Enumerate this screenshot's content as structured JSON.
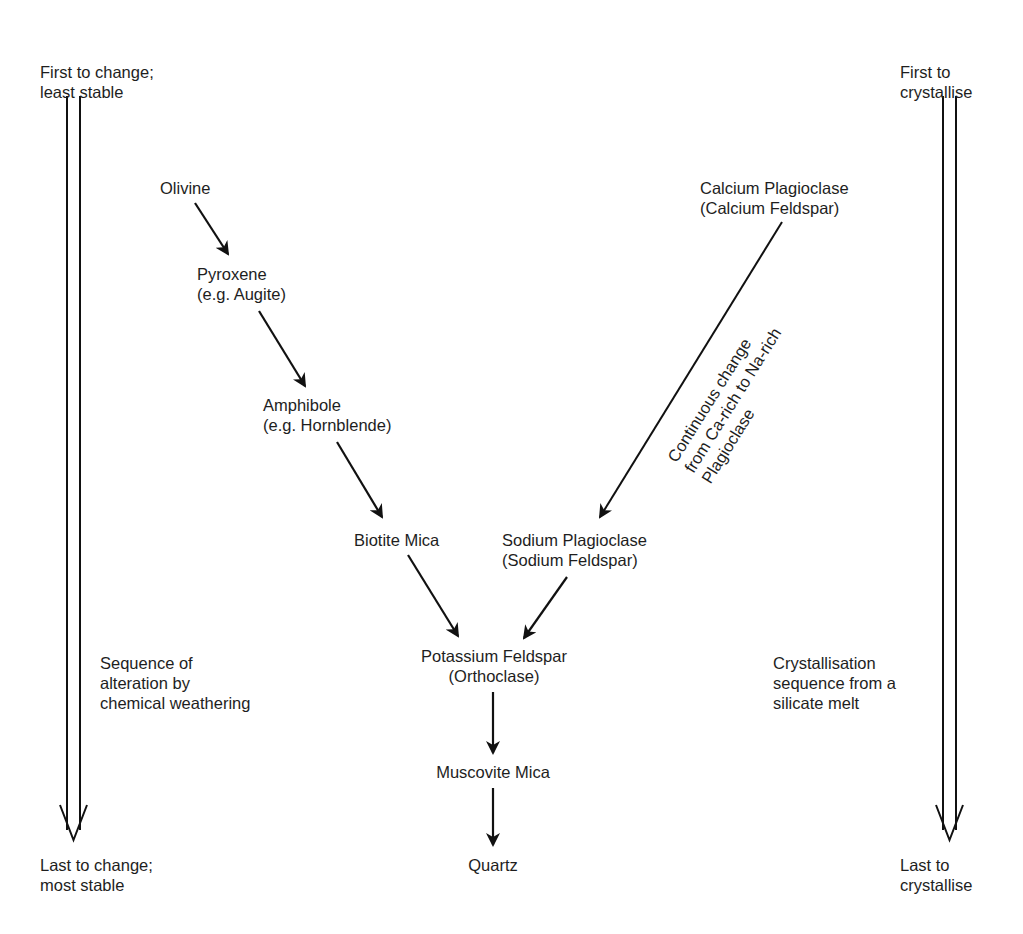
{
  "left_axis": {
    "top_label": [
      "First to change;",
      "least stable"
    ],
    "bottom_label": [
      "Last to change;",
      "most stable"
    ],
    "side_label": [
      "Sequence of",
      "alteration by",
      "chemical weathering"
    ]
  },
  "right_axis": {
    "top_label": [
      "First to",
      "crystallise"
    ],
    "bottom_label": [
      "Last to",
      "crystallise"
    ],
    "side_label": [
      "Crystallisation",
      "sequence from a",
      "silicate melt"
    ]
  },
  "discontinuous_series": {
    "minerals": [
      {
        "name": "Olivine",
        "detail": ""
      },
      {
        "name": "Pyroxene",
        "detail": "(e.g. Augite)"
      },
      {
        "name": "Amphibole",
        "detail": "(e.g. Hornblende)"
      },
      {
        "name": "Biotite Mica",
        "detail": ""
      }
    ]
  },
  "continuous_series": {
    "top": {
      "name": "Calcium Plagioclase",
      "detail": "(Calcium Feldspar)"
    },
    "bottom": {
      "name": "Sodium Plagioclase",
      "detail": "(Sodium Feldspar)"
    },
    "annotation": [
      "Continuous change",
      "from Ca-rich to Na-rich",
      "Plagioclase"
    ]
  },
  "final_series": {
    "minerals": [
      {
        "name": "Potassium Feldspar",
        "detail": "(Orthoclase)"
      },
      {
        "name": "Muscovite Mica",
        "detail": ""
      },
      {
        "name": "Quartz",
        "detail": ""
      }
    ]
  },
  "colors": {
    "line": "#111111",
    "text": "#1e1e1e",
    "background": "#ffffff"
  }
}
